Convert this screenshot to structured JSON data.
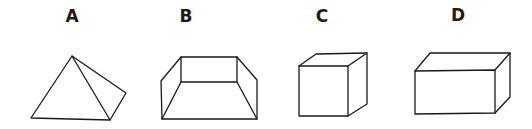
{
  "figures": [
    {
      "label": "A",
      "shape": "pyramid",
      "label_x": 72,
      "label_y": 8
    },
    {
      "label": "B",
      "shape": "open-box-trapezoid",
      "label_x": 186,
      "label_y": 8
    },
    {
      "label": "C",
      "shape": "cube",
      "label_x": 322,
      "label_y": 8
    },
    {
      "label": "D",
      "shape": "rectangular-prism",
      "label_x": 458,
      "label_y": 7
    }
  ],
  "colors": {
    "stroke": "#1a1a1a",
    "background": "#ffffff"
  }
}
